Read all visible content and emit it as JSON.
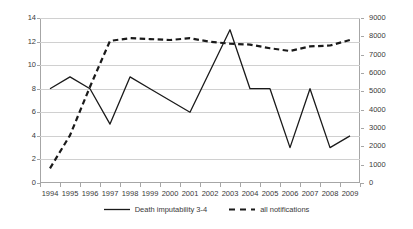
{
  "chart_data": {
    "type": "line",
    "title": "",
    "subtitle": "",
    "xlabel": "",
    "ylabel": "",
    "grid": true,
    "legend_position": "bottom",
    "categories": [
      "1994",
      "1995",
      "1996",
      "1997",
      "1998",
      "1999",
      "2000",
      "2001",
      "2002",
      "2003",
      "2004",
      "2005",
      "2006",
      "2007",
      "2008",
      "2009"
    ],
    "axes": {
      "left": {
        "label": "",
        "ylim": [
          0,
          14
        ],
        "tick_step": 2,
        "ticks": [
          "0",
          "2",
          "4",
          "6",
          "8",
          "10",
          "12",
          "14"
        ],
        "applies_to": "Death imputability 3-4"
      },
      "right": {
        "label": "",
        "ylim": [
          0,
          9000
        ],
        "tick_step": 1000,
        "ticks": [
          "0",
          "1000",
          "2000",
          "3000",
          "4000",
          "5000",
          "6000",
          "7000",
          "8000",
          "9000"
        ],
        "applies_to": "all notifications"
      }
    },
    "series": [
      {
        "name": "Death imputability 3-4",
        "axis": "left",
        "style": "solid",
        "color": "#1a1a1a",
        "values": [
          8,
          9,
          8,
          5,
          9,
          8,
          7,
          6,
          9.5,
          13,
          8,
          8,
          3,
          8,
          3,
          4
        ]
      },
      {
        "name": "all notifications",
        "axis": "right",
        "style": "dashed",
        "color": "#1a1a1a",
        "values": [
          800,
          2600,
          5250,
          7750,
          7900,
          7850,
          7800,
          7900,
          7700,
          7600,
          7550,
          7350,
          7200,
          7450,
          7500,
          7800
        ]
      }
    ],
    "legend": [
      {
        "label": "Death imputability 3-4",
        "style": "solid"
      },
      {
        "label": "all notifications",
        "style": "dashed"
      }
    ],
    "colors": {
      "gridline": "#d0d0d0",
      "axis": "#a6a6a6",
      "series": "#1a1a1a",
      "text": "#3a3a3a",
      "background": "#ffffff"
    }
  }
}
